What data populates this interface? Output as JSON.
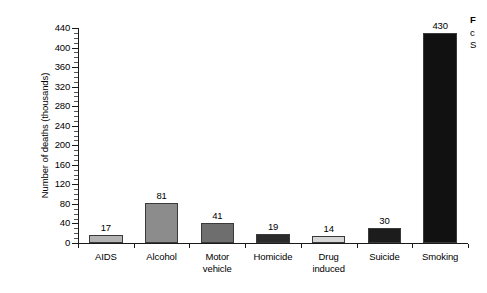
{
  "chart_data": {
    "type": "bar",
    "title": "",
    "xlabel": "",
    "ylabel": "Number of deaths (thousands)",
    "ylim": [
      0,
      440
    ],
    "ytick_step": 40,
    "minor_tick_step": 10,
    "grid": false,
    "legend": "none",
    "categories": [
      "AIDS",
      "Alcohol",
      "Motor vehicle",
      "Homicide",
      "Drug induced",
      "Suicide",
      "Smoking"
    ],
    "values": [
      17,
      81,
      41,
      19,
      14,
      30,
      430
    ],
    "bar_colors": [
      "#b3b3b3",
      "#8c8c8c",
      "#6e6e6e",
      "#2b2b2b",
      "#d6d6d6",
      "#1c1c1c",
      "#111111"
    ],
    "y_tick_labels": [
      "0",
      "40",
      "80",
      "120",
      "160",
      "200",
      "240",
      "280",
      "320",
      "360",
      "400",
      "440"
    ],
    "category_lines": [
      [
        "AIDS"
      ],
      [
        "Alcohol"
      ],
      [
        "Motor",
        "vehicle"
      ],
      [
        "Homicide"
      ],
      [
        "Drug",
        "induced"
      ],
      [
        "Suicide"
      ],
      [
        "Smoking"
      ]
    ]
  },
  "caption": {
    "title": "F",
    "line1": "c",
    "line2": "S"
  }
}
